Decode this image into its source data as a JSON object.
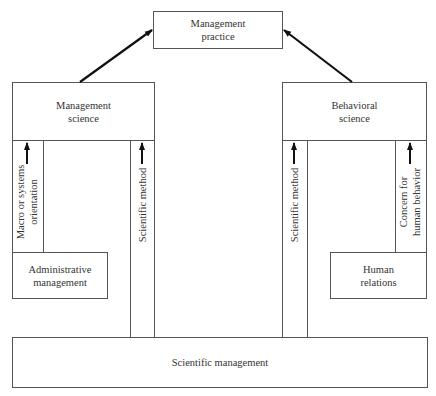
{
  "diagram": {
    "title": "",
    "nodes": {
      "management_practice": "Management\npractice",
      "management_science": "Management\nscience",
      "behavioral_science": "Behavioral\nscience",
      "administrative_management": "Administrative\nmanagement",
      "human_relations": "Human\nrelations",
      "scientific_management": "Scientific management"
    },
    "channels": {
      "macro_orientation": "Macro or systems\norientation",
      "scientific_method_left": "Scientific method",
      "scientific_method_right": "Scientific method",
      "concern_human_behavior": "Concern for\nhuman behavior"
    },
    "edges": [
      {
        "from": "management_science",
        "to": "management_practice"
      },
      {
        "from": "behavioral_science",
        "to": "management_practice"
      },
      {
        "from": "administrative_management",
        "to": "management_science",
        "label": "Macro or systems orientation"
      },
      {
        "from": "scientific_management",
        "to": "management_science",
        "label": "Scientific method"
      },
      {
        "from": "scientific_management",
        "to": "behavioral_science",
        "label": "Scientific method"
      },
      {
        "from": "human_relations",
        "to": "behavioral_science",
        "label": "Concern for human behavior"
      }
    ],
    "colors": {
      "line": "#555555",
      "arrow": "#111111",
      "background": "#ffffff"
    }
  }
}
